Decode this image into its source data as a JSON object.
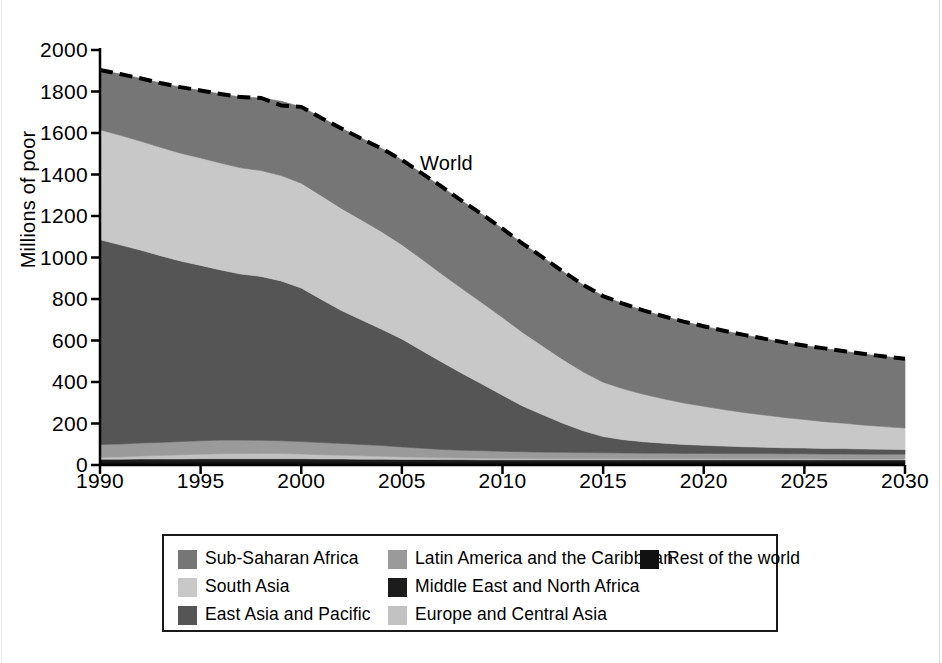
{
  "chart_data": {
    "type": "area",
    "stacked": true,
    "title": "",
    "subtitle": "",
    "xlabel": "",
    "ylabel": "Millions of poor",
    "xlim": [
      1990,
      2030
    ],
    "ylim": [
      0,
      2000
    ],
    "xticks": [
      1990,
      1995,
      2000,
      2005,
      2010,
      2015,
      2020,
      2025,
      2030
    ],
    "yticks": [
      0,
      200,
      400,
      600,
      800,
      1000,
      1200,
      1400,
      1600,
      1800,
      2000
    ],
    "grid": false,
    "legend_position": "bottom",
    "x": [
      1990,
      1991,
      1992,
      1993,
      1994,
      1995,
      1996,
      1997,
      1998,
      1999,
      2000,
      2001,
      2002,
      2003,
      2004,
      2005,
      2006,
      2007,
      2008,
      2009,
      2010,
      2011,
      2012,
      2013,
      2014,
      2015,
      2016,
      2017,
      2018,
      2019,
      2020,
      2021,
      2022,
      2023,
      2024,
      2025,
      2026,
      2027,
      2028,
      2029,
      2030
    ],
    "stack_order_bottom_to_top": [
      "Rest of the world",
      "Middle East and North Africa",
      "Europe and Central Asia",
      "Latin America and the Caribbean",
      "East Asia and Pacific",
      "South Asia",
      "Sub-Saharan Africa"
    ],
    "series": [
      {
        "name": "Rest of the world",
        "color": "#111111",
        "values": [
          14,
          14,
          14,
          14,
          14,
          14,
          14,
          14,
          14,
          14,
          14,
          14,
          14,
          14,
          14,
          14,
          14,
          14,
          14,
          14,
          14,
          14,
          14,
          14,
          14,
          14,
          14,
          14,
          14,
          14,
          14,
          14,
          14,
          14,
          14,
          14,
          14,
          14,
          14,
          14,
          14
        ]
      },
      {
        "name": "Middle East and North Africa",
        "color": "#1c1c1c",
        "values": [
          14,
          14,
          15,
          15,
          15,
          16,
          16,
          16,
          16,
          16,
          16,
          15,
          15,
          14,
          14,
          13,
          13,
          12,
          12,
          11,
          11,
          11,
          11,
          11,
          11,
          11,
          11,
          11,
          11,
          11,
          11,
          11,
          11,
          11,
          11,
          11,
          11,
          11,
          11,
          11,
          11
        ]
      },
      {
        "name": "Europe and Central Asia",
        "color": "#c2c2c2",
        "values": [
          9,
          11,
          14,
          17,
          20,
          22,
          24,
          25,
          26,
          25,
          23,
          21,
          18,
          16,
          14,
          12,
          10,
          9,
          8,
          8,
          7,
          7,
          6,
          6,
          6,
          6,
          5,
          5,
          5,
          5,
          5,
          5,
          5,
          5,
          5,
          5,
          4,
          4,
          4,
          4,
          4
        ]
      },
      {
        "name": "Latin America and the Caribbean",
        "color": "#9a9a9a",
        "values": [
          62,
          62,
          63,
          63,
          64,
          65,
          66,
          65,
          63,
          62,
          60,
          58,
          57,
          55,
          52,
          48,
          44,
          40,
          37,
          36,
          34,
          32,
          31,
          30,
          29,
          28,
          28,
          27,
          27,
          26,
          26,
          25,
          25,
          25,
          24,
          24,
          24,
          24,
          23,
          23,
          23
        ]
      },
      {
        "name": "East Asia and Pacific",
        "color": "#555555",
        "values": [
          987,
          960,
          930,
          900,
          870,
          845,
          820,
          800,
          790,
          770,
          740,
          690,
          640,
          600,
          560,
          520,
          470,
          420,
          370,
          320,
          270,
          220,
          180,
          140,
          105,
          78,
          64,
          55,
          48,
          43,
          39,
          36,
          33,
          31,
          29,
          28,
          27,
          26,
          25,
          24,
          23
        ]
      },
      {
        "name": "South Asia",
        "color": "#c8c8c8",
        "values": [
          530,
          528,
          525,
          522,
          520,
          518,
          515,
          512,
          510,
          508,
          505,
          500,
          492,
          482,
          470,
          455,
          440,
          424,
          408,
          392,
          375,
          355,
          332,
          308,
          284,
          262,
          245,
          229,
          214,
          200,
          188,
          176,
          165,
          155,
          146,
          137,
          129,
          122,
          115,
          109,
          103
        ]
      },
      {
        "name": "Sub-Saharan Africa",
        "color": "#767676",
        "values": [
          288,
          295,
          303,
          310,
          318,
          325,
          333,
          341,
          350,
          358,
          368,
          377,
          386,
          394,
          401,
          408,
          414,
          419,
          423,
          426,
          428,
          428,
          427,
          424,
          420,
          415,
          410,
          404,
          398,
          392,
          386,
          380,
          374,
          368,
          362,
          357,
          352,
          347,
          342,
          338,
          334
        ]
      }
    ],
    "total_line": {
      "name": "World",
      "style": "dashed",
      "color": "#000000",
      "values": [
        1904,
        1884,
        1864,
        1841,
        1821,
        1805,
        1788,
        1773,
        1769,
        1733,
        1726,
        1672,
        1622,
        1572,
        1525,
        1470,
        1405,
        1340,
        1272,
        1207,
        1139,
        1067,
        1001,
        933,
        869,
        814,
        777,
        745,
        717,
        691,
        669,
        647,
        627,
        609,
        591,
        576,
        562,
        548,
        535,
        523,
        512
      ]
    },
    "annotations": [
      {
        "text": "World",
        "x": 2006,
        "y": 1510
      }
    ],
    "legend_entries": [
      {
        "label": "Sub-Saharan Africa",
        "color": "#767676"
      },
      {
        "label": "South Asia",
        "color": "#c8c8c8"
      },
      {
        "label": "East Asia and Pacific",
        "color": "#555555"
      },
      {
        "label": "Latin America and the Caribbean",
        "color": "#9a9a9a"
      },
      {
        "label": "Middle East and North Africa",
        "color": "#1c1c1c"
      },
      {
        "label": "Europe and Central Asia",
        "color": "#c2c2c2"
      },
      {
        "label": "Rest of the world",
        "color": "#111111"
      }
    ]
  },
  "axes": {
    "y_title": "Millions of poor",
    "y_tick_labels": [
      "2000",
      "1800",
      "1600",
      "1400",
      "1200",
      "1000",
      "800",
      "600",
      "400",
      "200",
      "0"
    ],
    "x_tick_labels": [
      "1990",
      "1995",
      "2000",
      "2005",
      "2010",
      "2015",
      "2020",
      "2025",
      "2030"
    ]
  },
  "legend": {
    "columns": [
      [
        {
          "label": "Sub-Saharan Africa",
          "color": "#767676"
        },
        {
          "label": "South Asia",
          "color": "#c8c8c8"
        },
        {
          "label": "East Asia and Pacific",
          "color": "#555555"
        }
      ],
      [
        {
          "label": "Latin America and the Caribbean",
          "color": "#9a9a9a"
        },
        {
          "label": "Middle East and North Africa",
          "color": "#1c1c1c"
        },
        {
          "label": "Europe and Central Asia",
          "color": "#c2c2c2"
        }
      ],
      [
        {
          "label": "Rest of the world",
          "color": "#111111"
        }
      ]
    ]
  },
  "annotation": {
    "world_label": "World"
  },
  "colors": {
    "axis": "#000000",
    "background": "#ffffff",
    "total_line": "#000000"
  }
}
